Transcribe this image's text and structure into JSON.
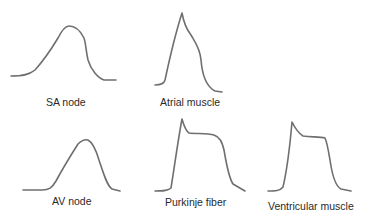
{
  "stroke_color": "#6f6f6f",
  "label_color": "#2a2a2a",
  "panels": [
    {
      "id": "sa-node",
      "label": "SA node",
      "row": 1,
      "column": 1,
      "shape": "slow rounded rise, broad dome, gradual fall"
    },
    {
      "id": "atrial-muscle",
      "label": "Atrial muscle",
      "row": 1,
      "column": 2,
      "shape": "fast upstroke to sharp peak, short shoulder, gradual repolarization"
    },
    {
      "id": "av-node",
      "label": "AV node",
      "row": 2,
      "column": 1,
      "shape": "slow rounded rise, dome, gradual fall"
    },
    {
      "id": "purkinje-fiber",
      "label": "Purkinje fiber",
      "row": 2,
      "column": 2,
      "shape": "rapid upstroke with spike, notch, long plateau, repolarization"
    },
    {
      "id": "ventricular-muscle",
      "label": "Ventricular muscle",
      "row": 2,
      "column": 3,
      "shape": "rapid upstroke with spike, notch, long plateau, repolarization"
    }
  ]
}
